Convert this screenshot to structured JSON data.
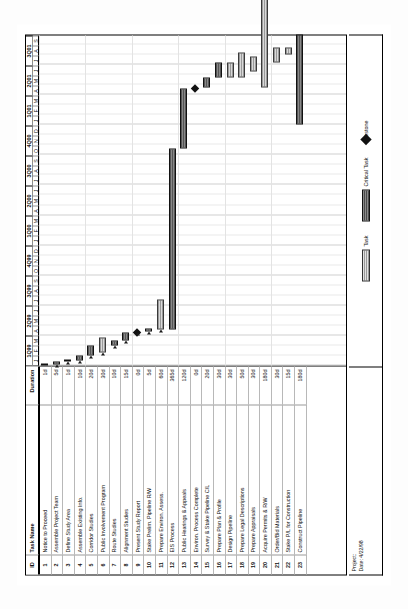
{
  "document": {
    "type": "gantt-chart",
    "orientation": "landscape-rotated"
  },
  "table": {
    "headers": {
      "id": "ID",
      "name": "Task Name",
      "duration": "Duration"
    },
    "rows": [
      {
        "id": "1",
        "name": "Notice to Proceed",
        "duration": "1d"
      },
      {
        "id": "2",
        "name": "Assemble Project Team",
        "duration": "5d"
      },
      {
        "id": "3",
        "name": "Define Study Area",
        "duration": "1d"
      },
      {
        "id": "4",
        "name": "Assemble Existing Info.",
        "duration": "10d"
      },
      {
        "id": "5",
        "name": "Corridor Studies",
        "duration": "20d"
      },
      {
        "id": "6",
        "name": "Public Involvement Program",
        "duration": "30d"
      },
      {
        "id": "7",
        "name": "Route Studies",
        "duration": "10d"
      },
      {
        "id": "8",
        "name": "Alignment Studies",
        "duration": "15d"
      },
      {
        "id": "9",
        "name": "Present Study Report",
        "duration": "0d"
      },
      {
        "id": "10",
        "name": "Stake Prelim. Pipeline R/W",
        "duration": "5d"
      },
      {
        "id": "11",
        "name": "Prepare Environ. Assess.",
        "duration": "60d"
      },
      {
        "id": "12",
        "name": "EIS Process",
        "duration": "365d"
      },
      {
        "id": "13",
        "name": "Public Hearings & Appeals",
        "duration": "120d"
      },
      {
        "id": "14",
        "name": "Environ. Process Complete",
        "duration": "0d"
      },
      {
        "id": "15",
        "name": "Survey & Stake Pipeline C/L",
        "duration": "20d"
      },
      {
        "id": "16",
        "name": "Prepare Plan & Profile",
        "duration": "30d"
      },
      {
        "id": "17",
        "name": "Design Pipeline",
        "duration": "30d"
      },
      {
        "id": "18",
        "name": "Prepare Legal Descriptions",
        "duration": "50d"
      },
      {
        "id": "19",
        "name": "Prepare Appraisals",
        "duration": "30d"
      },
      {
        "id": "20",
        "name": "Acquire Permits & R/W",
        "duration": "180d"
      },
      {
        "id": "21",
        "name": "Order/Bid Materials",
        "duration": "30d"
      },
      {
        "id": "22",
        "name": "Stake P/L for Construction",
        "duration": "15d"
      },
      {
        "id": "23",
        "name": "Construct Pipeline",
        "duration": "180d"
      }
    ]
  },
  "timeline": {
    "quarters": [
      "1Q99",
      "2Q99",
      "3Q99",
      "4Q99",
      "1Q00",
      "2Q00",
      "3Q00",
      "4Q00",
      "1Q01",
      "2Q01",
      "3Q01"
    ],
    "months": [
      "J",
      "F",
      "M",
      "A",
      "M",
      "J",
      "J",
      "A",
      "S",
      "O",
      "N",
      "D",
      "J",
      "F",
      "M",
      "A",
      "M",
      "J",
      "J",
      "A",
      "S",
      "O",
      "N",
      "D",
      "J",
      "F",
      "M",
      "A",
      "M",
      "J",
      "J",
      "A",
      "S"
    ],
    "start_label": "1Q99",
    "end_label": "3Q01"
  },
  "chart_data": {
    "type": "bar",
    "xlabel": "",
    "ylabel": "",
    "categories": [
      "Notice to Proceed",
      "Assemble Project Team",
      "Define Study Area",
      "Assemble Existing Info.",
      "Corridor Studies",
      "Public Involvement Program",
      "Route Studies",
      "Alignment Studies",
      "Present Study Report",
      "Stake Prelim. Pipeline R/W",
      "Prepare Environ. Assess.",
      "EIS Process",
      "Public Hearings & Appeals",
      "Environ. Process Complete",
      "Survey & Stake Pipeline C/L",
      "Prepare Plan & Profile",
      "Design Pipeline",
      "Prepare Legal Descriptions",
      "Prepare Appraisals",
      "Acquire Permits & R/W",
      "Order/Bid Materials",
      "Stake P/L for Construction",
      "Construct Pipeline"
    ],
    "values": [
      1,
      5,
      1,
      10,
      20,
      30,
      10,
      15,
      0,
      5,
      60,
      365,
      120,
      0,
      20,
      30,
      30,
      50,
      30,
      180,
      30,
      15,
      180
    ],
    "unit": "days",
    "bars": [
      {
        "id": "1",
        "start_month": 0.0,
        "months": 0.05,
        "kind": "critical"
      },
      {
        "id": "2",
        "start_month": 0.1,
        "months": 0.25,
        "kind": "critical"
      },
      {
        "id": "3",
        "start_month": 0.4,
        "months": 0.05,
        "kind": "critical"
      },
      {
        "id": "4",
        "start_month": 0.5,
        "months": 0.5,
        "kind": "critical"
      },
      {
        "id": "5",
        "start_month": 1.0,
        "months": 1.0,
        "kind": "critical"
      },
      {
        "id": "6",
        "start_month": 1.3,
        "months": 1.5,
        "kind": "normal"
      },
      {
        "id": "7",
        "start_month": 2.0,
        "months": 0.5,
        "kind": "critical"
      },
      {
        "id": "8",
        "start_month": 2.5,
        "months": 0.75,
        "kind": "critical"
      },
      {
        "id": "9",
        "start_month": 3.3,
        "months": 0.0,
        "kind": "milestone"
      },
      {
        "id": "10",
        "start_month": 3.4,
        "months": 0.25,
        "kind": "critical"
      },
      {
        "id": "11",
        "start_month": 3.6,
        "months": 3.0,
        "kind": "normal"
      },
      {
        "id": "12",
        "start_month": 3.6,
        "months": 18.0,
        "kind": "critical"
      },
      {
        "id": "13",
        "start_month": 21.6,
        "months": 6.0,
        "kind": "critical"
      },
      {
        "id": "14",
        "start_month": 27.6,
        "months": 0.0,
        "kind": "milestone"
      },
      {
        "id": "15",
        "start_month": 27.7,
        "months": 1.0,
        "kind": "critical"
      },
      {
        "id": "16",
        "start_month": 28.7,
        "months": 1.5,
        "kind": "critical"
      },
      {
        "id": "17",
        "start_month": 28.7,
        "months": 1.5,
        "kind": "normal"
      },
      {
        "id": "18",
        "start_month": 28.7,
        "months": 2.5,
        "kind": "normal"
      },
      {
        "id": "19",
        "start_month": 29.3,
        "months": 1.5,
        "kind": "normal"
      },
      {
        "id": "20",
        "start_month": 27.7,
        "months": 9.0,
        "kind": "normal"
      },
      {
        "id": "21",
        "start_month": 30.2,
        "months": 1.5,
        "kind": "normal"
      },
      {
        "id": "22",
        "start_month": 31.0,
        "months": 0.75,
        "kind": "normal"
      },
      {
        "id": "23",
        "start_month": 24.0,
        "months": 9.0,
        "kind": "critical"
      }
    ]
  },
  "legend": {
    "task_label": "Task",
    "critical_label": "Critical Task",
    "milestone_label": "Milestone"
  },
  "footer": {
    "project_label": "Project:",
    "date_label": "Date: 4/22/98"
  }
}
